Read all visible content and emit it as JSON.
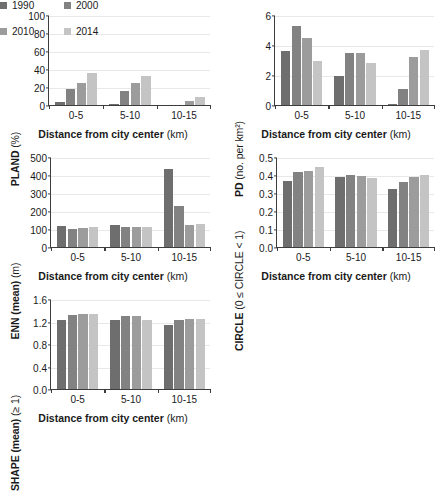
{
  "legend": {
    "position": "bottom-right",
    "entries": [
      {
        "label": "1990",
        "color": "#6e6e6e"
      },
      {
        "label": "2000",
        "color": "#828282"
      },
      {
        "label": "2010",
        "color": "#9c9c9c"
      },
      {
        "label": "2014",
        "color": "#c4c4c4"
      }
    ]
  },
  "common": {
    "xlabel_main": "Distance from city center",
    "xlabel_unit": "(km)",
    "categories": [
      "0-5",
      "5-10",
      "10-15"
    ]
  },
  "chart_data": [
    {
      "id": "pland",
      "type": "bar",
      "title": "",
      "ylabel_main": "PLAND",
      "ylabel_unit": "(%)",
      "xlabel": "Distance from city center (km)",
      "categories": [
        "0-5",
        "5-10",
        "10-15"
      ],
      "series": [
        {
          "name": "1990",
          "values": [
            3.5,
            0.8,
            0
          ]
        },
        {
          "name": "2000",
          "values": [
            18,
            16,
            0
          ]
        },
        {
          "name": "2010",
          "values": [
            25,
            24,
            4.5
          ]
        },
        {
          "name": "2014",
          "values": [
            36,
            32,
            8.5
          ]
        }
      ],
      "ylim": [
        0,
        100
      ],
      "yticks": [
        0,
        20,
        40,
        60,
        80,
        100
      ],
      "ytick_labels": [
        "0",
        "20",
        "40",
        "60",
        "80",
        "100"
      ],
      "grid": true
    },
    {
      "id": "pd",
      "type": "bar",
      "title": "",
      "ylabel_main": "PD",
      "ylabel_unit": "(no. per km²)",
      "xlabel": "Distance from city center (km)",
      "categories": [
        "0-5",
        "5-10",
        "10-15"
      ],
      "series": [
        {
          "name": "1990",
          "values": [
            3.6,
            1.95,
            0.1
          ]
        },
        {
          "name": "2000",
          "values": [
            5.3,
            3.5,
            1.1
          ]
        },
        {
          "name": "2010",
          "values": [
            4.45,
            3.5,
            3.2
          ]
        },
        {
          "name": "2014",
          "values": [
            2.95,
            2.8,
            3.7
          ]
        }
      ],
      "ylim": [
        0,
        6
      ],
      "yticks": [
        0,
        2,
        4,
        6
      ],
      "ytick_labels": [
        "0",
        "2",
        "4",
        "6"
      ],
      "grid": true
    },
    {
      "id": "enn",
      "type": "bar",
      "title": "",
      "ylabel_main": "ENN (mean)",
      "ylabel_unit": "(m)",
      "xlabel": "Distance from city center (km)",
      "categories": [
        "0-5",
        "5-10",
        "10-15"
      ],
      "series": [
        {
          "name": "1990",
          "values": [
            118,
            123,
            435
          ]
        },
        {
          "name": "2000",
          "values": [
            100,
            113,
            230
          ]
        },
        {
          "name": "2010",
          "values": [
            107,
            110,
            122
          ]
        },
        {
          "name": "2014",
          "values": [
            113,
            110,
            128
          ]
        }
      ],
      "ylim": [
        0,
        500
      ],
      "yticks": [
        0,
        100,
        200,
        300,
        400,
        500
      ],
      "ytick_labels": [
        "0",
        "100",
        "200",
        "300",
        "400",
        "500"
      ],
      "grid": true
    },
    {
      "id": "circle",
      "type": "bar",
      "title": "",
      "ylabel_main": "CIRCLE",
      "ylabel_unit": "(0 ≤ CIRCLE < 1)",
      "xlabel": "Distance from city center (km)",
      "categories": [
        "0-5",
        "5-10",
        "10-15"
      ],
      "series": [
        {
          "name": "1990",
          "values": [
            0.368,
            0.39,
            0.32
          ]
        },
        {
          "name": "2000",
          "values": [
            0.418,
            0.398,
            0.36
          ]
        },
        {
          "name": "2010",
          "values": [
            0.425,
            0.397,
            0.387
          ]
        },
        {
          "name": "2014",
          "values": [
            0.443,
            0.383,
            0.4
          ]
        }
      ],
      "ylim": [
        0,
        0.5
      ],
      "yticks": [
        0,
        0.1,
        0.2,
        0.3,
        0.4,
        0.5
      ],
      "ytick_labels": [
        "0.0",
        "0.1",
        "0.2",
        "0.3",
        "0.4",
        "0.5"
      ],
      "grid": true
    },
    {
      "id": "shape",
      "type": "bar",
      "title": "",
      "ylabel_main": "SHAPE (mean)",
      "ylabel_unit": "(≥ 1)",
      "xlabel": "Distance from city center (km)",
      "categories": [
        "0-5",
        "5-10",
        "10-15"
      ],
      "series": [
        {
          "name": "1990",
          "values": [
            1.22,
            1.22,
            1.14
          ]
        },
        {
          "name": "2000",
          "values": [
            1.31,
            1.29,
            1.23
          ]
        },
        {
          "name": "2010",
          "values": [
            1.33,
            1.29,
            1.25
          ]
        },
        {
          "name": "2014",
          "values": [
            1.33,
            1.22,
            1.24
          ]
        }
      ],
      "ylim": [
        0,
        1.6
      ],
      "yticks": [
        0,
        0.4,
        0.8,
        1.2,
        1.6
      ],
      "ytick_labels": [
        "0.0",
        "0.4",
        "0.8",
        "1.2",
        "1.6"
      ],
      "grid": true
    }
  ]
}
